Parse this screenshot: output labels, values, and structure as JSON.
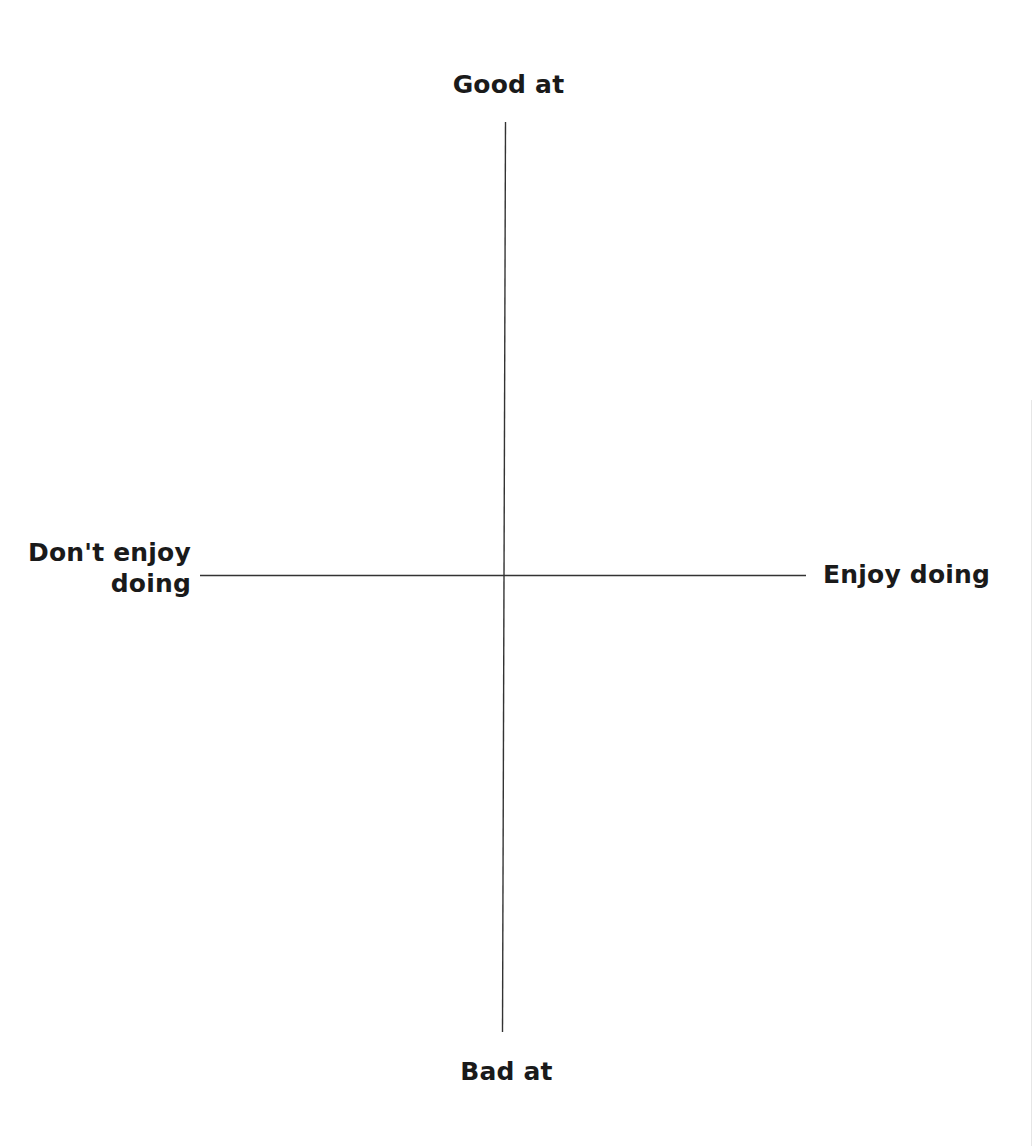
{
  "diagram": {
    "type": "quadrant-matrix",
    "axes": {
      "vertical": {
        "top_label": "Good at",
        "bottom_label": "Bad at"
      },
      "horizontal": {
        "left_label_line1": "Don't enjoy",
        "left_label_line2": "doing",
        "right_label": "Enjoy doing"
      }
    },
    "colors": {
      "axis_line": "#333333",
      "text": "#1a1a1a",
      "background": "#ffffff"
    }
  }
}
